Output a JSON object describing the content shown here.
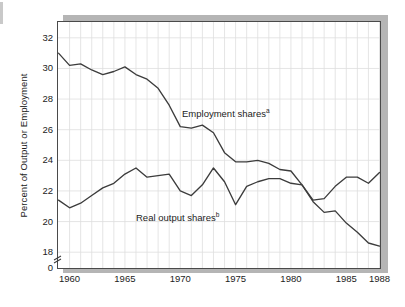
{
  "chart_data": {
    "type": "line",
    "title": "",
    "subtitle": "",
    "xlabel": "",
    "ylabel": "Percent of Output or Employment",
    "xlim": [
      1959,
      1988
    ],
    "ylim": [
      17.0,
      33.0
    ],
    "y_axis_break": true,
    "y_break_value": 0,
    "grid": true,
    "grid_interval_x": 1,
    "legend_position": "inline-annotation",
    "yticks": [
      "0",
      "18",
      "20",
      "22",
      "24",
      "26",
      "28",
      "30",
      "32"
    ],
    "ytick_values": [
      0,
      18,
      20,
      22,
      24,
      26,
      28,
      30,
      32
    ],
    "xticks": [
      "1960",
      "1965",
      "1970",
      "1975",
      "1980",
      "1985",
      "1988"
    ],
    "xtick_values": [
      1960,
      1965,
      1970,
      1975,
      1980,
      1985,
      1988
    ],
    "x": [
      1959,
      1960,
      1961,
      1962,
      1963,
      1964,
      1965,
      1966,
      1967,
      1968,
      1969,
      1970,
      1971,
      1972,
      1973,
      1974,
      1975,
      1976,
      1977,
      1978,
      1979,
      1980,
      1981,
      1982,
      1983,
      1984,
      1985,
      1986,
      1987,
      1988
    ],
    "series": [
      {
        "name": "Employment shares",
        "footnote": "a",
        "color": "#3c3c3c",
        "values": [
          31.0,
          30.2,
          30.3,
          29.9,
          29.6,
          29.8,
          30.1,
          29.6,
          29.3,
          28.7,
          27.6,
          26.2,
          26.1,
          26.3,
          25.8,
          24.5,
          23.9,
          23.9,
          24.0,
          23.8,
          23.4,
          23.3,
          22.4,
          21.3,
          20.6,
          20.7,
          19.9,
          19.3,
          18.6,
          18.4
        ]
      },
      {
        "name": "Real output shares",
        "footnote": "b",
        "color": "#3c3c3c",
        "values": [
          21.4,
          20.9,
          21.2,
          21.7,
          22.2,
          22.5,
          23.1,
          23.5,
          22.9,
          23.0,
          23.1,
          22.0,
          21.7,
          22.4,
          23.5,
          22.6,
          21.1,
          22.3,
          22.6,
          22.8,
          22.8,
          22.5,
          22.4,
          21.4,
          21.5,
          22.3,
          22.9,
          22.9,
          22.5,
          23.2
        ]
      }
    ],
    "annotations": [
      {
        "name": "employment-shares-label",
        "text": "Employment shares",
        "footnote": "a",
        "x_px": 182,
        "y_px": 108
      },
      {
        "name": "real-output-shares-label",
        "text": "Real output shares",
        "footnote": "b",
        "x_px": 136,
        "y_px": 212
      }
    ]
  },
  "axis": {
    "ylabel": "Percent of Output or Employment",
    "yticks": [
      {
        "label": "32",
        "value": 32
      },
      {
        "label": "30",
        "value": 30
      },
      {
        "label": "28",
        "value": 28
      },
      {
        "label": "26",
        "value": 26
      },
      {
        "label": "24",
        "value": 24
      },
      {
        "label": "22",
        "value": 22
      },
      {
        "label": "20",
        "value": 20
      },
      {
        "label": "18",
        "value": 18
      },
      {
        "label": "0",
        "value": 0
      }
    ],
    "xticks": [
      {
        "label": "1960",
        "value": 1960
      },
      {
        "label": "1965",
        "value": 1965
      },
      {
        "label": "1970",
        "value": 1970
      },
      {
        "label": "1975",
        "value": 1975
      },
      {
        "label": "1980",
        "value": 1980
      },
      {
        "label": "1985",
        "value": 1985
      },
      {
        "label": "1988",
        "value": 1988
      }
    ]
  },
  "labels": {
    "employment": "Employment shares",
    "employment_sup": "a",
    "output": "Real output shares",
    "output_sup": "b"
  },
  "colors": {
    "line": "#3c3c3c",
    "grid": "#dedede",
    "frame": "#4a4a4a",
    "shadow": "#b5b5b5",
    "text": "#1c1c1c",
    "background": "#ffffff"
  }
}
